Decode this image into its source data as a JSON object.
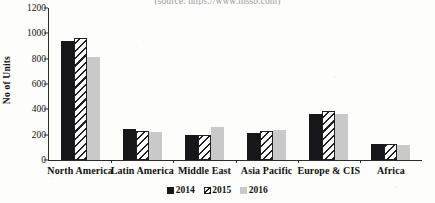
{
  "source_caption": "(source: https://www.ihssb.com)",
  "chart_data": {
    "type": "bar",
    "title": "",
    "xlabel": "",
    "ylabel": "No of Units",
    "ylim": [
      0,
      1200
    ],
    "ytick_values": [
      0,
      200,
      400,
      600,
      800,
      1000,
      1200
    ],
    "ytick_labels": [
      "0",
      "200",
      "400",
      "600",
      "800",
      "1000",
      "1200"
    ],
    "grid": false,
    "legend_position": "bottom",
    "categories": [
      "North America",
      "Latin America",
      "Middle East",
      "Asia Pacific",
      "Europe & CIS",
      "Africa"
    ],
    "series": [
      {
        "name": "2014",
        "color": "#17171a",
        "fill": "solid-black",
        "values": [
          940,
          245,
          195,
          210,
          365,
          130
        ]
      },
      {
        "name": "2015",
        "color": "#ffffff",
        "fill": "diagonal-hatch",
        "values": [
          965,
          230,
          200,
          230,
          390,
          125
        ]
      },
      {
        "name": "2016",
        "color": "#c9c9c9",
        "fill": "solid-gray",
        "values": [
          815,
          225,
          260,
          235,
          360,
          115
        ]
      }
    ]
  }
}
